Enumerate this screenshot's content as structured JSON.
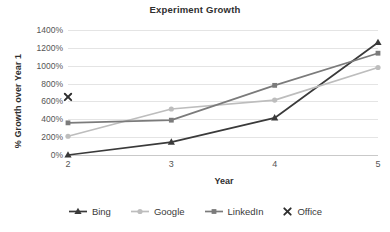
{
  "chart_data": {
    "type": "line",
    "title": "Experiment Growth",
    "xlabel": "Year",
    "ylabel": "% Growth over Year 1",
    "categories": [
      "2",
      "3",
      "4",
      "5"
    ],
    "x": [
      2,
      3,
      4,
      5
    ],
    "ylim": [
      0,
      1400
    ],
    "ytick_labels": [
      "0%",
      "200%",
      "400%",
      "600%",
      "800%",
      "1000%",
      "1200%",
      "1400%"
    ],
    "ytick_values": [
      0,
      200,
      400,
      600,
      800,
      1000,
      1200,
      1400
    ],
    "ytick_suffix": "%",
    "grid": true,
    "legend_position": "bottom",
    "series": [
      {
        "name": "Bing",
        "marker": "triangle",
        "color": "#3a3a3a",
        "values": [
          0,
          145,
          415,
          1260
        ]
      },
      {
        "name": "Google",
        "marker": "circle",
        "color": "#bdbdbd",
        "values": [
          210,
          515,
          615,
          980
        ]
      },
      {
        "name": "LinkedIn",
        "marker": "square",
        "color": "#7b7b7b",
        "values": [
          360,
          390,
          780,
          1140
        ]
      },
      {
        "name": "Office",
        "marker": "x",
        "color": "#2f2f2f",
        "values": [
          650,
          null,
          null,
          null
        ]
      }
    ]
  },
  "legend": {
    "items": [
      {
        "label": "Bing"
      },
      {
        "label": "Google"
      },
      {
        "label": "LinkedIn"
      },
      {
        "label": "Office"
      }
    ]
  }
}
